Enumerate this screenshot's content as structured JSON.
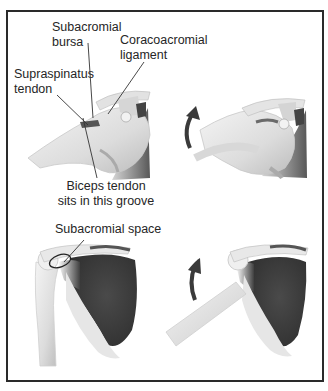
{
  "figure": {
    "panels": [
      {
        "id": "top-left",
        "description": "Shoulder side view, arm at rest, with labelled structures"
      },
      {
        "id": "top-right",
        "description": "Shoulder side view, arm raised, curved arrow showing rotation"
      },
      {
        "id": "bottom-left",
        "description": "Front view of shoulder blade and humerus, arm down, subacromial space circled"
      },
      {
        "id": "bottom-right",
        "description": "Front view of shoulder blade, arm abducted, curved arrow showing elevation"
      }
    ],
    "labels": {
      "subacromial_bursa_1": "Subacromial",
      "subacromial_bursa_2": "bursa",
      "coracoacromial_1": "Coracoacromial",
      "coracoacromial_2": "ligament",
      "supraspinatus_1": "Supraspinatus",
      "supraspinatus_2": "tendon",
      "biceps_1": "Biceps tendon",
      "biceps_2": "sits in this groove",
      "subacromial_space": "Subacromial space"
    },
    "colors": {
      "border": "#2a2a2a",
      "muscle_dark": "#3c3c3c",
      "bone_light": "#e8e8e8",
      "leader_line": "#333333",
      "arrow": "#3a3a3a"
    }
  }
}
